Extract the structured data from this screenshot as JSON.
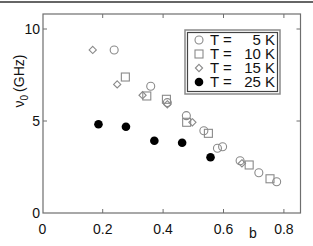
{
  "chart_data": {
    "type": "scatter",
    "title": "",
    "xlabel": "b",
    "ylabel": "ν0 (GHz)",
    "ylabel_main": "ν",
    "ylabel_sub": "0",
    "ylabel_unit": "(GHz)",
    "xlim": [
      0,
      0.85
    ],
    "ylim": [
      0,
      10.5
    ],
    "xticks": [
      0,
      0.2,
      0.4,
      0.6,
      0.8
    ],
    "xtick_labels": [
      "0",
      "0.2",
      "0.4",
      "0.6",
      "0.8"
    ],
    "yticks": [
      0,
      5,
      10
    ],
    "ytick_labels": [
      "0",
      "5",
      "10"
    ],
    "grid": false,
    "legend_position": "upper right",
    "series": [
      {
        "name": "T =  5 K",
        "marker": "circle-open",
        "color": "#8a8a8a",
        "points": [
          [
            0.238,
            8.86
          ],
          [
            0.359,
            6.89
          ],
          [
            0.414,
            6.0
          ],
          [
            0.477,
            5.29
          ],
          [
            0.535,
            4.47
          ],
          [
            0.58,
            3.52
          ],
          [
            0.597,
            3.6
          ],
          [
            0.655,
            2.84
          ],
          [
            0.717,
            2.19
          ],
          [
            0.776,
            1.7
          ]
        ]
      },
      {
        "name": "T = 10 K",
        "marker": "square-open",
        "color": "#8a8a8a",
        "points": [
          [
            0.275,
            7.39
          ],
          [
            0.346,
            6.36
          ],
          [
            0.411,
            6.18
          ],
          [
            0.478,
            4.93
          ],
          [
            0.55,
            4.33
          ],
          [
            0.685,
            2.61
          ],
          [
            0.754,
            1.86
          ]
        ]
      },
      {
        "name": "T = 15 K",
        "marker": "diamond-open",
        "color": "#8a8a8a",
        "points": [
          [
            0.167,
            8.86
          ],
          [
            0.248,
            6.99
          ],
          [
            0.332,
            6.4
          ],
          [
            0.414,
            5.91
          ],
          [
            0.497,
            4.93
          ],
          [
            0.661,
            2.7
          ]
        ]
      },
      {
        "name": "T = 25 K",
        "marker": "circle-filled",
        "color": "#000000",
        "points": [
          [
            0.186,
            4.82
          ],
          [
            0.277,
            4.69
          ],
          [
            0.371,
            3.93
          ],
          [
            0.463,
            3.82
          ],
          [
            0.557,
            3.03
          ]
        ]
      }
    ]
  },
  "legend": {
    "entries": [
      {
        "prefix": "T =",
        "value": "5 K"
      },
      {
        "prefix": "T =",
        "value": "10 K"
      },
      {
        "prefix": "T =",
        "value": "15 K"
      },
      {
        "prefix": "T =",
        "value": "25 K"
      }
    ]
  },
  "colors": {
    "axis": "#6e6e6e",
    "open_marker": "#8a8a8a",
    "filled_marker": "#000000",
    "legend_outer_border": "#8a8a8a",
    "legend_inner_border": "#444444",
    "top_rule": "#333333"
  }
}
